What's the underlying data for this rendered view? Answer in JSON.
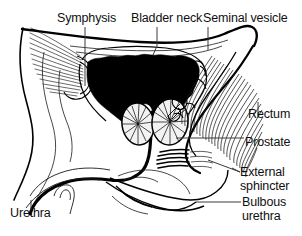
{
  "figure": {
    "kind": "anatomical-diagram",
    "view": "midsagittal-section",
    "background_color": "#ffffff",
    "ink_color": "#000000",
    "width": 302,
    "height": 236
  },
  "labels": {
    "symphysis": "Symphysis",
    "bladder_neck": "Bladder neck",
    "seminal_vesicle": "Seminal vesicle",
    "rectum": "Rectum",
    "prostate": "Prostate",
    "external_sphincter": "External\nsphincter",
    "bulbous_urethra": "Bulbous\nurethra",
    "urethra": "Urethra"
  },
  "structures": [
    {
      "name": "bladder",
      "rendering": "solid-black-fill",
      "label_ref": "bladder_neck"
    },
    {
      "name": "prostate",
      "rendering": "two-lobes-radial-hatching",
      "label_ref": "prostate"
    },
    {
      "name": "rectum",
      "rendering": "dense-curved-fan-hatching",
      "label_ref": "rectum"
    },
    {
      "name": "seminal-vesicle",
      "rendering": "convoluted-tubule-outline",
      "label_ref": "seminal_vesicle"
    },
    {
      "name": "pubic-symphysis",
      "rendering": "fan-line-shading",
      "label_ref": "symphysis"
    },
    {
      "name": "urethra",
      "rendering": "thick-black-curve",
      "label_ref": "urethra"
    },
    {
      "name": "external-sphincter",
      "rendering": "short-dark-striations",
      "label_ref": "external_sphincter"
    },
    {
      "name": "bulbous-urethra",
      "rendering": "outline-bulb",
      "label_ref": "bulbous_urethra"
    }
  ]
}
